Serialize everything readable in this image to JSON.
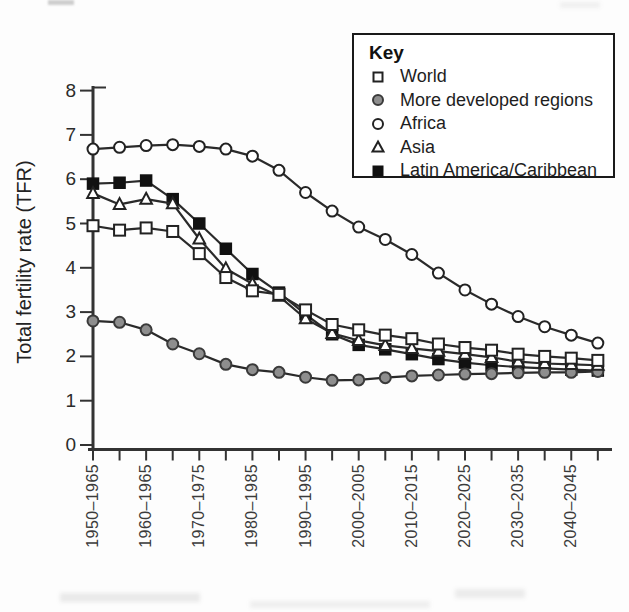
{
  "figure": {
    "y_axis_title": "Total fertility rate (TFR)",
    "legend": {
      "title": "Key",
      "items": [
        {
          "label": "World",
          "marker": "square-open"
        },
        {
          "label": "More developed regions",
          "marker": "circle-filled-gray"
        },
        {
          "label": "Africa",
          "marker": "circle-open"
        },
        {
          "label": "Asia",
          "marker": "triangle-open"
        },
        {
          "label": "Latin America/Caribbean",
          "marker": "square-filled"
        }
      ]
    },
    "colors": {
      "line": "#2a2a2a",
      "marker_stroke": "#222222",
      "gray_marker_fill": "#8e8e8e",
      "filled_marker": "#111111",
      "axis": "#333333",
      "text": "#222222"
    }
  },
  "chart_data": {
    "type": "line",
    "title": "",
    "xlabel": "",
    "ylabel": "Total fertility rate (TFR)",
    "ylim": [
      0,
      8
    ],
    "y_ticks": [
      0,
      1,
      2,
      3,
      4,
      5,
      6,
      7,
      8
    ],
    "grid": false,
    "legend_position": "top-right-inside",
    "x_tick_count": 20,
    "x_tick_label_placement": "every-other-tick-starting-first",
    "x_tick_labels": [
      "1950–1965",
      "1960–1965",
      "1970–1975",
      "1980–1985",
      "1990–1995",
      "2000–2005",
      "2010–2015",
      "2020–2025",
      "2030–2035",
      "2040–2045"
    ],
    "series": [
      {
        "name": "World",
        "marker": "square-open",
        "values": [
          4.95,
          4.85,
          4.9,
          4.82,
          4.32,
          3.78,
          3.48,
          3.4,
          3.05,
          2.72,
          2.6,
          2.48,
          2.4,
          2.28,
          2.2,
          2.14,
          2.05,
          2.0,
          1.96,
          1.91
        ]
      },
      {
        "name": "More developed regions",
        "marker": "circle-filled-gray",
        "values": [
          2.8,
          2.77,
          2.6,
          2.28,
          2.06,
          1.82,
          1.7,
          1.64,
          1.53,
          1.46,
          1.47,
          1.52,
          1.56,
          1.58,
          1.6,
          1.61,
          1.63,
          1.64,
          1.64,
          1.66
        ]
      },
      {
        "name": "Africa",
        "marker": "circle-open",
        "values": [
          6.68,
          6.72,
          6.76,
          6.78,
          6.74,
          6.68,
          6.52,
          6.2,
          5.7,
          5.28,
          4.92,
          4.64,
          4.3,
          3.88,
          3.5,
          3.18,
          2.9,
          2.67,
          2.48,
          2.3
        ]
      },
      {
        "name": "Asia",
        "marker": "triangle-open",
        "values": [
          5.68,
          5.43,
          5.55,
          5.45,
          4.65,
          3.98,
          3.64,
          3.36,
          2.85,
          2.52,
          2.36,
          2.25,
          2.18,
          2.12,
          2.05,
          1.98,
          1.88,
          1.84,
          1.82,
          1.8
        ]
      },
      {
        "name": "Latin America/Caribbean",
        "marker": "square-filled",
        "values": [
          5.9,
          5.92,
          5.97,
          5.55,
          5.0,
          4.43,
          3.86,
          3.44,
          2.95,
          2.5,
          2.26,
          2.16,
          2.05,
          1.94,
          1.86,
          1.8,
          1.76,
          1.73,
          1.7,
          1.68
        ]
      }
    ]
  }
}
